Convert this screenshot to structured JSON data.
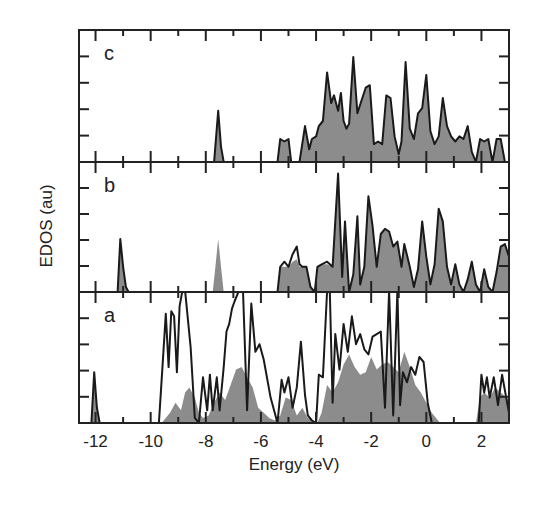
{
  "chart_data": {
    "type": "area",
    "title": "",
    "xlabel": "Energy (eV)",
    "ylabel": "EDOS (au)",
    "xlim": [
      -12.6,
      3.0
    ],
    "xticks": [
      -12,
      -10,
      -8,
      -6,
      -4,
      -2,
      0,
      2
    ],
    "xtick_labels": [
      "-12",
      "-10",
      "-8",
      "-6",
      "-4",
      "-2",
      "0",
      "2"
    ],
    "grid": false,
    "legend": null,
    "colors": {
      "fill": "#8c8c8c",
      "line": "#1a1a1a",
      "frame": "#222222"
    },
    "panels": [
      {
        "label": "c",
        "ylim": [
          0,
          5
        ],
        "series": [
          {
            "name": "total (line)",
            "style": "line",
            "x": [
              -12.6,
              -7.7,
              -7.55,
              -7.45,
              -7.35,
              -7.2,
              -5.4,
              -5.3,
              -5.15,
              -5.0,
              -4.9,
              -4.75,
              -4.6,
              -4.4,
              -4.25,
              -4.15,
              -4.0,
              -3.9,
              -3.75,
              -3.6,
              -3.45,
              -3.35,
              -3.2,
              -3.1,
              -3.0,
              -2.9,
              -2.8,
              -2.65,
              -2.5,
              -2.35,
              -2.2,
              -2.05,
              -1.9,
              -1.75,
              -1.6,
              -1.45,
              -1.3,
              -1.15,
              -1.0,
              -0.9,
              -0.75,
              -0.6,
              -0.45,
              -0.3,
              -0.15,
              0.0,
              0.15,
              0.3,
              0.45,
              0.6,
              0.75,
              0.9,
              1.05,
              1.2,
              1.35,
              1.5,
              1.65,
              1.8,
              1.95,
              2.1,
              2.25,
              2.4,
              2.55,
              2.7,
              2.85,
              3.0
            ],
            "y": [
              0,
              0,
              2.0,
              0.6,
              0,
              0,
              0,
              0.9,
              0.8,
              0.9,
              0,
              0,
              0,
              1.4,
              0.5,
              0.9,
              1.0,
              1.4,
              1.6,
              3.5,
              2.3,
              2.6,
              2.0,
              2.7,
              1.6,
              1.3,
              1.5,
              4.1,
              1.9,
              2.4,
              2.9,
              3.0,
              0.7,
              0.8,
              0.7,
              2.6,
              2.5,
              1.0,
              0.3,
              0.8,
              3.9,
              1.3,
              0.9,
              1.9,
              2.1,
              3.4,
              1.2,
              0.7,
              1.0,
              2.5,
              1.4,
              1.0,
              0.8,
              1.0,
              0.9,
              1.4,
              0.4,
              0,
              0.9,
              0.8,
              0.9,
              0,
              0.9,
              0.9,
              0,
              0
            ]
          },
          {
            "name": "partial (filled)",
            "style": "fill",
            "same_as": "total"
          }
        ]
      },
      {
        "label": "b",
        "ylim": [
          0,
          5
        ],
        "series": [
          {
            "name": "total (line)",
            "style": "line",
            "x": [
              -12.6,
              -11.2,
              -11.1,
              -11.0,
              -10.9,
              -10.8,
              -7.7,
              -7.55,
              -7.45,
              -7.35,
              -7.2,
              -5.4,
              -5.3,
              -5.15,
              -5.0,
              -4.85,
              -4.7,
              -4.6,
              -4.5,
              -4.35,
              -4.2,
              -4.05,
              -3.95,
              -3.8,
              -3.6,
              -3.4,
              -3.2,
              -3.05,
              -2.95,
              -2.8,
              -2.65,
              -2.5,
              -2.4,
              -2.25,
              -2.1,
              -1.95,
              -1.8,
              -1.65,
              -1.5,
              -1.35,
              -1.2,
              -1.05,
              -0.9,
              -0.8,
              -0.6,
              -0.45,
              -0.3,
              -0.15,
              0.0,
              0.15,
              0.3,
              0.45,
              0.6,
              0.75,
              0.9,
              1.05,
              1.2,
              1.35,
              1.5,
              1.65,
              1.8,
              1.95,
              2.1,
              2.25,
              2.4,
              2.55,
              2.7,
              2.85,
              3.0
            ],
            "y": [
              0,
              0,
              2.1,
              1.0,
              0.2,
              0,
              0,
              0,
              0,
              0,
              0,
              0,
              1.0,
              1.2,
              1.0,
              1.5,
              1.8,
              1.1,
              1.0,
              1.0,
              0.2,
              0,
              1.0,
              1.1,
              1.2,
              1.0,
              4.7,
              0.6,
              2.8,
              0,
              0.7,
              3.0,
              0.3,
              1.0,
              3.8,
              2.6,
              1.0,
              2.3,
              2.5,
              2.4,
              1.8,
              2.0,
              1.0,
              1.9,
              1.0,
              0.2,
              0.9,
              2.8,
              1.4,
              0.3,
              1.1,
              3.3,
              2.8,
              1.0,
              0.3,
              1.1,
              0.3,
              0,
              0.5,
              1.2,
              0.3,
              0,
              0.9,
              0.2,
              0,
              0.8,
              1.8,
              1.9,
              1.4
            ]
          },
          {
            "name": "partial (filled)",
            "style": "fill",
            "x": [
              -12.6,
              -11.2,
              -11.1,
              -11.0,
              -10.9,
              -10.8,
              -7.75,
              -7.65,
              -7.55,
              -7.45,
              -7.35,
              -5.4,
              -5.3,
              -5.15,
              -5.0,
              -4.85,
              -4.7,
              -4.6,
              -4.5,
              -4.35,
              -4.2,
              -4.05,
              -3.95,
              -3.8,
              -3.6,
              -3.4,
              -3.2,
              -3.05,
              -2.95,
              -2.8,
              -2.65,
              -2.5,
              -2.4,
              -2.25,
              -2.1,
              -1.95,
              -1.8,
              -1.65,
              -1.5,
              -1.35,
              -1.2,
              -1.05,
              -0.9,
              -0.8,
              -0.6,
              -0.45,
              -0.3,
              -0.15,
              0.0,
              0.15,
              0.3,
              0.45,
              0.6,
              0.75,
              0.9,
              1.05,
              1.2,
              1.35,
              1.5,
              1.65,
              1.8,
              1.95,
              2.1,
              2.25,
              2.4,
              2.55,
              2.7,
              2.85,
              3.0
            ],
            "y": [
              0,
              0,
              2.0,
              0.9,
              0.2,
              0,
              0,
              1.0,
              2.1,
              1.0,
              0,
              0,
              1.0,
              1.0,
              1.0,
              1.2,
              1.3,
              1.0,
              1.0,
              1.0,
              0.2,
              0,
              1.0,
              1.1,
              1.1,
              1.0,
              4.7,
              0.6,
              2.8,
              0,
              0.7,
              3.0,
              0.3,
              1.0,
              3.8,
              2.6,
              1.0,
              2.3,
              2.5,
              2.4,
              1.8,
              2.0,
              1.0,
              1.9,
              1.0,
              0.2,
              0.9,
              2.8,
              1.4,
              0.3,
              1.1,
              3.2,
              2.8,
              1.0,
              0.3,
              1.1,
              0.3,
              0,
              0.5,
              1.2,
              0.3,
              0,
              0.9,
              0.2,
              0,
              0.8,
              1.8,
              1.9,
              1.4
            ]
          }
        ]
      },
      {
        "label": "a",
        "ylim": [
          0,
          5
        ],
        "series": [
          {
            "name": "total (line)",
            "style": "line",
            "x": [
              -12.6,
              -12.15,
              -12.05,
              -11.95,
              -11.85,
              -9.7,
              -9.55,
              -9.45,
              -9.35,
              -9.25,
              -9.15,
              -9.05,
              -8.95,
              -8.85,
              -8.75,
              -8.55,
              -8.4,
              -8.25,
              -8.1,
              -7.95,
              -7.85,
              -7.75,
              -7.6,
              -7.5,
              -7.35,
              -7.25,
              -7.15,
              -7.05,
              -6.95,
              -6.8,
              -6.65,
              -6.5,
              -6.35,
              -6.2,
              -6.05,
              -5.9,
              -5.65,
              -5.4,
              -5.25,
              -5.15,
              -5.0,
              -4.85,
              -4.7,
              -4.55,
              -4.4,
              -4.3,
              -4.15,
              -4.0,
              -3.9,
              -3.75,
              -3.6,
              -3.5,
              -3.4,
              -3.3,
              -3.15,
              -3.0,
              -2.85,
              -2.7,
              -2.55,
              -2.4,
              -2.25,
              -2.1,
              -1.95,
              -1.8,
              -1.65,
              -1.5,
              -1.35,
              -1.2,
              -1.05,
              -0.95,
              -0.85,
              -0.7,
              -0.55,
              -0.4,
              -0.25,
              -0.1,
              0.05,
              0.2,
              0.35,
              0.5,
              0.6,
              1.9,
              2.0,
              2.1,
              2.2,
              2.3,
              2.45,
              2.6,
              2.75,
              2.9,
              3.0
            ],
            "y": [
              0,
              0,
              2.0,
              0.6,
              0,
              0,
              2.6,
              4.3,
              2.2,
              4.4,
              4.2,
              2.0,
              4.6,
              5.2,
              5.2,
              3.0,
              0.2,
              0,
              1.8,
              0.5,
              1.9,
              0.5,
              1.8,
              0.5,
              2.2,
              3.6,
              3.9,
              4.5,
              4.8,
              5.2,
              5.2,
              0.5,
              4.7,
              2.8,
              3.1,
              2.5,
              1.0,
              0,
              1.7,
              1.2,
              1.8,
              0.6,
              1.4,
              3.2,
              1.1,
              0.3,
              0.1,
              0,
              1.9,
              1.8,
              5.2,
              5.2,
              0.8,
              3.5,
              2.1,
              3.9,
              2.8,
              4.2,
              3.1,
              3.5,
              2.9,
              2.7,
              3.4,
              3.5,
              3.6,
              0.6,
              5.2,
              0.3,
              5.2,
              0.7,
              2.0,
              1.6,
              2.2,
              1.9,
              2.6,
              2.4,
              0.8,
              0,
              0,
              0,
              0,
              0,
              1.9,
              1.2,
              1.8,
              1.0,
              1.8,
              0.7,
              1.9,
              1.0,
              0.4
            ],
            "note": "line clipped at panel top in several places (values exceed ylim)"
          },
          {
            "name": "partial (filled)",
            "style": "fill",
            "x": [
              -12.6,
              -12.15,
              -12.05,
              -11.95,
              -11.85,
              -9.6,
              -9.3,
              -9.1,
              -8.9,
              -8.75,
              -8.6,
              -8.4,
              -8.25,
              -8.1,
              -7.9,
              -7.7,
              -7.5,
              -7.3,
              -7.1,
              -6.9,
              -6.7,
              -6.5,
              -6.3,
              -6.1,
              -5.9,
              -5.7,
              -5.5,
              -5.3,
              -5.1,
              -4.9,
              -4.7,
              -4.5,
              -4.3,
              -4.1,
              -3.95,
              -3.8,
              -3.6,
              -3.4,
              -3.2,
              -3.0,
              -2.8,
              -2.6,
              -2.4,
              -2.2,
              -2.0,
              -1.8,
              -1.6,
              -1.4,
              -1.2,
              -1.0,
              -0.8,
              -0.6,
              -0.4,
              -0.2,
              0.0,
              0.2,
              0.35,
              0.5,
              1.8,
              1.95,
              2.1,
              2.3,
              2.5,
              2.7,
              2.9,
              3.0
            ],
            "y": [
              0,
              0,
              2.0,
              0.6,
              0,
              0,
              0.4,
              0.8,
              0.5,
              1.2,
              1.4,
              1.0,
              0.4,
              0.2,
              0.3,
              0.8,
              1.2,
              0.9,
              1.5,
              2.1,
              2.2,
              1.8,
              1.4,
              0.6,
              0.4,
              0.2,
              0.1,
              0.3,
              1.0,
              0.9,
              0.3,
              0.6,
              0.2,
              0.1,
              0,
              0.4,
              1.5,
              1.2,
              1.6,
              2.3,
              2.7,
              2.2,
              1.9,
              2.0,
              2.6,
              2.1,
              2.3,
              2.4,
              2.2,
              2.0,
              2.8,
              2.2,
              1.5,
              1.2,
              0.8,
              0.4,
              0.2,
              0,
              0,
              1.0,
              1.2,
              1.0,
              1.4,
              1.2,
              1.0,
              0.9
            ]
          }
        ]
      }
    ]
  }
}
